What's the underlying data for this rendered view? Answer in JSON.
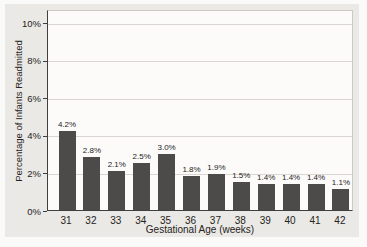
{
  "figure": {
    "background_color": "#ebe9e5",
    "plot_background_color": "#fcfbfa",
    "bar_color": "#4d4b49",
    "grid_color": "#d9d6d2",
    "axis_color": "#403f3d",
    "text_color": "#242322"
  },
  "chart_data": {
    "type": "bar",
    "title": "",
    "xlabel": "Gestational Age (weeks)",
    "ylabel": "Percentage of Infants Readmitted",
    "categories": [
      "31",
      "32",
      "33",
      "34",
      "35",
      "36",
      "37",
      "38",
      "39",
      "40",
      "41",
      "42"
    ],
    "values": [
      4.2,
      2.8,
      2.1,
      2.5,
      3.0,
      1.8,
      1.9,
      1.5,
      1.4,
      1.4,
      1.4,
      1.1
    ],
    "bar_labels": [
      "4.2%",
      "2.8%",
      "2.1%",
      "2.5%",
      "3.0%",
      "1.8%",
      "1.9%",
      "1.5%",
      "1.4%",
      "1.4%",
      "1.4%",
      "1.1%"
    ],
    "yticks": [
      {
        "value": 0,
        "label": "0%"
      },
      {
        "value": 2,
        "label": "2%"
      },
      {
        "value": 4,
        "label": "4%"
      },
      {
        "value": 6,
        "label": "6%"
      },
      {
        "value": 8,
        "label": "8%"
      },
      {
        "value": 10,
        "label": "10%"
      }
    ],
    "ylim": [
      0,
      10.7
    ],
    "grid": "horizontal",
    "legend": "none"
  }
}
